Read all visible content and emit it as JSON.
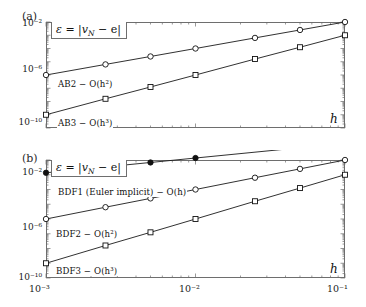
{
  "figure": {
    "panels": [
      {
        "tag": "(a)",
        "error_label_eps": "ε",
        "error_label_eq": " = |",
        "error_label_v": "v",
        "error_label_N": "N",
        "error_label_tail": " − e|",
        "xlabel": "h",
        "yticks": [
          "10⁻²",
          "10⁻⁶",
          "10⁻¹⁰"
        ],
        "curves": [
          {
            "label_text": "AB2 − O(h²)",
            "label_name": "AB2",
            "order": 2,
            "marker": "open-circle"
          },
          {
            "label_text": "AB3 − O(h³)",
            "label_name": "AB3",
            "order": 3,
            "marker": "open-square"
          }
        ]
      },
      {
        "tag": "(b)",
        "error_label_eps": "ε",
        "error_label_eq": " = |",
        "error_label_v": "v",
        "error_label_N": "N",
        "error_label_tail": " − e|",
        "xlabel": "h",
        "yticks": [
          "10⁻²",
          "10⁻⁶",
          "10⁻¹⁰"
        ],
        "xticks": [
          "10⁻³",
          "10⁻²",
          "10⁻¹"
        ],
        "curves": [
          {
            "label_text": "BDF1 (Euler implicit) − O(h)",
            "label_name": "BDF1",
            "order": 1,
            "marker": "filled-circle"
          },
          {
            "label_text": "BDF2 − O(h²)",
            "label_name": "BDF2",
            "order": 2,
            "marker": "open-circle"
          },
          {
            "label_text": "BDF3 − O(h³)",
            "label_name": "BDF3",
            "order": 3,
            "marker": "open-square"
          }
        ]
      }
    ]
  },
  "chart_data": [
    {
      "type": "line",
      "panel": "(a)",
      "title": "",
      "xlabel": "h",
      "ylabel": "ε = |v_N − e|",
      "xscale": "log",
      "yscale": "log",
      "xlim": [
        0.001,
        0.1
      ],
      "ylim": [
        1e-10,
        0.01
      ],
      "xticks": [
        0.001,
        0.01,
        0.1
      ],
      "xticklabels": [
        "10⁻³",
        "10⁻²",
        "10⁻¹"
      ],
      "yticks": [
        0.01,
        1e-06,
        1e-10
      ],
      "yticklabels": [
        "10⁻²",
        "10⁻⁶",
        "10⁻¹⁰"
      ],
      "grid": false,
      "legend": "inline-annotations",
      "x": [
        0.001,
        0.0025,
        0.005,
        0.01,
        0.025,
        0.05,
        0.1
      ],
      "series": [
        {
          "name": "AB2 − O(h²)",
          "marker": "open-circle",
          "slope": 2,
          "values": [
            1e-06,
            6.3e-06,
            2.5e-05,
            0.0001,
            0.00063,
            0.0025,
            0.01
          ]
        },
        {
          "name": "AB3 − O(h³)",
          "marker": "open-square",
          "slope": 3,
          "values": [
            1e-09,
            1.6e-08,
            1.25e-07,
            1e-06,
            1.6e-05,
            0.000125,
            0.001
          ]
        }
      ]
    },
    {
      "type": "line",
      "panel": "(b)",
      "title": "",
      "xlabel": "h",
      "ylabel": "ε = |v_N − e|",
      "xscale": "log",
      "yscale": "log",
      "xlim": [
        0.001,
        0.1
      ],
      "ylim": [
        1e-10,
        0.01
      ],
      "xticks": [
        0.001,
        0.01,
        0.1
      ],
      "xticklabels": [
        "10⁻³",
        "10⁻²",
        "10⁻¹"
      ],
      "yticks": [
        0.01,
        1e-06,
        1e-10
      ],
      "yticklabels": [
        "10⁻²",
        "10⁻⁶",
        "10⁻¹⁰"
      ],
      "grid": false,
      "legend": "inline-annotations",
      "x": [
        0.001,
        0.0025,
        0.005,
        0.01,
        0.025,
        0.05,
        0.1
      ],
      "series": [
        {
          "name": "BDF1 (Euler implicit) − O(h)",
          "marker": "filled-circle",
          "slope": 1,
          "values": [
            0.00136,
            0.0034,
            0.0068,
            0.0136,
            0.034,
            0.068,
            0.136
          ]
        },
        {
          "name": "BDF2 − O(h²)",
          "marker": "open-circle",
          "slope": 2,
          "values": [
            1e-06,
            6.3e-06,
            2.5e-05,
            0.0001,
            0.00063,
            0.0025,
            0.01
          ]
        },
        {
          "name": "BDF3 − O(h³)",
          "marker": "open-square",
          "slope": 3,
          "values": [
            1e-09,
            1.6e-08,
            1.25e-07,
            1e-06,
            1.6e-05,
            0.000125,
            0.001
          ]
        }
      ]
    }
  ]
}
